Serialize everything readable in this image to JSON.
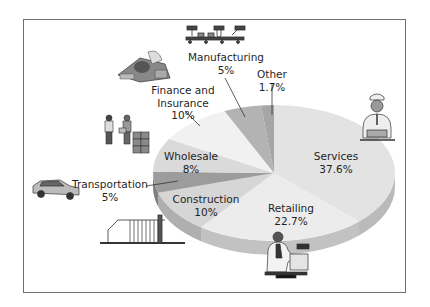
{
  "chart_data": {
    "type": "pie",
    "style": "3d-exploded-illustrated",
    "title": "",
    "categories": [
      "Services",
      "Retailing",
      "Construction",
      "Transportation",
      "Wholesale",
      "Finance and Insurance",
      "Manufacturing",
      "Other"
    ],
    "values": [
      37.6,
      22.7,
      10,
      5,
      8,
      10,
      5,
      1.7
    ],
    "unit": "%",
    "legend": "none (direct labels)",
    "labels": [
      {
        "name": "Services",
        "value": "37.6%"
      },
      {
        "name": "Retailing",
        "value": "22.7%"
      },
      {
        "name": "Construction",
        "value": "10%"
      },
      {
        "name": "Transportation",
        "value": "5%"
      },
      {
        "name": "Wholesale",
        "value": "8%"
      },
      {
        "name": "Finance and Insurance",
        "value": "10%"
      },
      {
        "name": "Manufacturing",
        "value": "5%"
      },
      {
        "name": "Other",
        "value": "1.7%"
      }
    ]
  },
  "labels": {
    "services": {
      "name": "Services",
      "value": "37.6%"
    },
    "retailing": {
      "name": "Retailing",
      "value": "22.7%"
    },
    "construction": {
      "name": "Construction",
      "value": "10%"
    },
    "transportation": {
      "name": "Transportation",
      "value": "5%"
    },
    "wholesale": {
      "name": "Wholesale",
      "value": "8%"
    },
    "finance": {
      "line1": "Finance and",
      "line2": "Insurance",
      "value": "10%"
    },
    "manufacturing": {
      "name": "Manufacturing",
      "value": "5%"
    },
    "other": {
      "name": "Other",
      "value": "1.7%"
    }
  },
  "colors": {
    "services": "#e3e3e3",
    "retailing": "#ececec",
    "construction": "#d6d6d6",
    "transportation": "#9c9c9c",
    "wholesale": "#dadada",
    "finance": "#f1f1f1",
    "manufacturing": "#b3b3b3",
    "other": "#a6a6a6",
    "frame": "#6e6e6e"
  },
  "illustrations": [
    "manufacturing-conveyor-icon",
    "money-pile-icon",
    "wholesale-workers-boxes-icon",
    "taxi-car-icon",
    "house-frame-icon",
    "service-worker-icon",
    "retail-cashier-icon"
  ]
}
